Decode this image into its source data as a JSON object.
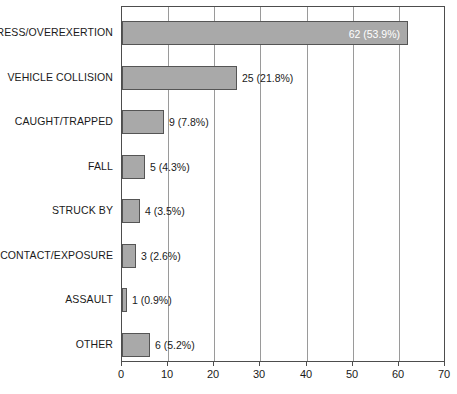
{
  "chart_data": {
    "type": "bar",
    "orientation": "horizontal",
    "title": "",
    "subtitle": "",
    "xlabel": "",
    "ylabel": "",
    "xlim": [
      0,
      70
    ],
    "xticks": [
      0,
      10,
      20,
      30,
      40,
      50,
      60,
      70
    ],
    "xtick_labels": [
      "0",
      "10",
      "20",
      "30",
      "40",
      "50",
      "60",
      "70"
    ],
    "grid": true,
    "grid_axis": "x",
    "legend": false,
    "bar_color": "#a9a9a9",
    "bar_edge_color": "#555555",
    "frame_color": "#4d4d4d",
    "gridline_color": "#9a9a9a",
    "inside_label_color": "#ffffff",
    "outside_label_color": "#1a1a1a",
    "categories": [
      "STRESS/OVEREXERTION",
      "VEHICLE COLLISION",
      "CAUGHT/TRAPPED",
      "FALL",
      "STRUCK BY",
      "CONTACT/EXPOSURE",
      "ASSAULT",
      "OTHER"
    ],
    "values": [
      62,
      25,
      9,
      5,
      4,
      3,
      1,
      6
    ],
    "percents": [
      53.9,
      21.8,
      7.8,
      4.3,
      3.5,
      2.6,
      0.9,
      5.2
    ],
    "data_labels": [
      "62 (53.9%)",
      "25 (21.8%)",
      "9 (7.8%)",
      "5 (4.3%)",
      "4 (3.5%)",
      "3 (2.6%)",
      "1 (0.9%)",
      "6 (5.2%)"
    ],
    "label_placement": [
      "inside",
      "outside",
      "outside",
      "outside",
      "outside",
      "outside",
      "outside",
      "outside"
    ],
    "total": 115
  }
}
